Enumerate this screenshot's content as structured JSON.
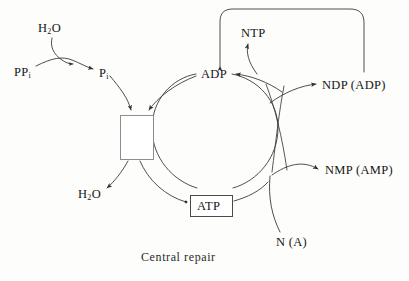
{
  "diagram": {
    "title": "Central repair",
    "caption": "Central repair",
    "type": "metabolic-cycle-diagram",
    "colors": {
      "stroke": "#3a3a3a",
      "box_border": "#4a4a4a",
      "dna_box_border": "#8d8d8d",
      "text": "#151515",
      "background": "#fdfdfc"
    },
    "nodes": [
      {
        "id": "ppi",
        "label": "PP",
        "sub": "i",
        "x": 14,
        "y": 66
      },
      {
        "id": "h2o_top",
        "label": "H",
        "sub": "2",
        "label2": "O",
        "x": 38,
        "y": 22
      },
      {
        "id": "pi",
        "label": "P",
        "sub": "i",
        "x": 99,
        "y": 67
      },
      {
        "id": "h2o_bottom",
        "label": "H",
        "sub": "2",
        "label2": "O",
        "x": 78,
        "y": 188
      },
      {
        "id": "adp",
        "label": "ADP",
        "x": 201,
        "y": 68
      },
      {
        "id": "ntp",
        "label": "NTP",
        "x": 241,
        "y": 27
      },
      {
        "id": "ndp",
        "label": "NDP (ADP)",
        "x": 322,
        "y": 79
      },
      {
        "id": "nmp",
        "label": "NMP (AMP)",
        "x": 325,
        "y": 164
      },
      {
        "id": "n_a",
        "label": "N (A)",
        "x": 276,
        "y": 236
      },
      {
        "id": "atp",
        "label": "ATP",
        "x": 197,
        "y": 199
      }
    ],
    "boxes": [
      {
        "id": "dna-repair-box",
        "label": "",
        "icon": "dna-strand-icon",
        "x": 120,
        "y": 115,
        "w": 34,
        "h": 45
      },
      {
        "id": "atp-box",
        "label": "ATP",
        "x": 190,
        "y": 195,
        "w": 43,
        "h": 22
      }
    ],
    "edges": [
      {
        "id": "ppi-to-pi",
        "from": "PPi",
        "to": "Pi",
        "kind": "arrow"
      },
      {
        "id": "h2o-into-ppi-pi",
        "from": "H2O",
        "to": "PPi to Pi reaction",
        "kind": "arrow"
      },
      {
        "id": "pi-to-repairbox",
        "from": "Pi",
        "to": "repair complex",
        "kind": "arrow"
      },
      {
        "id": "adparc-to-repairbox",
        "from": "ADP cycle",
        "to": "repair complex",
        "kind": "arrow"
      },
      {
        "id": "repairbox-to-h2o",
        "from": "repair complex",
        "to": "H2O",
        "kind": "arrow"
      },
      {
        "id": "repairbox-to-atp",
        "from": "repair complex",
        "to": "ATP",
        "kind": "arrow"
      },
      {
        "id": "atp-to-adp-cycle",
        "from": "ATP",
        "to": "ADP",
        "kind": "arc"
      },
      {
        "id": "ndp-to-adp",
        "from": "NDP (ADP)",
        "to": "ADP",
        "kind": "arrow"
      },
      {
        "id": "cycle-to-ntp",
        "from": "cycle",
        "to": "NTP",
        "kind": "arrow"
      },
      {
        "id": "ntp-loop-to-adp",
        "from": "NTP top loop",
        "to": "ADP",
        "kind": "arrow"
      },
      {
        "id": "cycle-to-ndp",
        "from": "cycle",
        "to": "NDP (ADP)",
        "kind": "arrow"
      },
      {
        "id": "cycle-to-nmp",
        "from": "cycle",
        "to": "NMP (AMP)",
        "kind": "arrow"
      },
      {
        "id": "na-to-cycle",
        "from": "N (A)",
        "to": "cycle",
        "kind": "arc"
      }
    ]
  }
}
